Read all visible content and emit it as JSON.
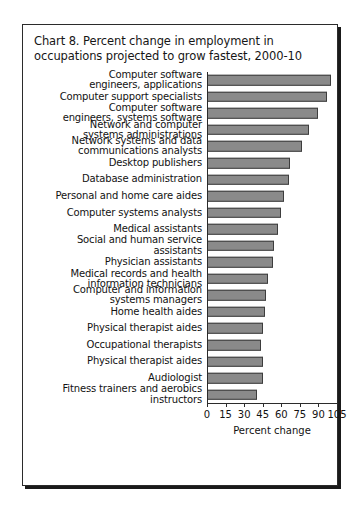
{
  "figure": {
    "title": "Chart 8. Percent change in employment in occupations projected to grow fastest, 2000-10",
    "frame_border_color": "#2b2b2b",
    "background_color": "#ffffff"
  },
  "chart_data": {
    "type": "bar",
    "orientation": "horizontal",
    "title": "Chart 8. Percent change in employment in occupations projected to grow fastest, 2000-10",
    "xlabel": "Percent change",
    "ylabel": "",
    "xlim": [
      0,
      105
    ],
    "xticks": [
      0,
      15,
      30,
      45,
      60,
      75,
      90,
      105
    ],
    "xtick_labels": [
      "0",
      "15",
      "30",
      "45",
      "60",
      "75",
      "90",
      "105"
    ],
    "grid": false,
    "legend": null,
    "bar_color": "#8a8a8a",
    "bar_edge_color": "#3d3d3d",
    "categories": [
      "Computer software\nengineers, applications",
      "Computer support specialists",
      "Computer software\nengineers, systems software",
      "Network and computer\nsystems administrations",
      "Network systems and data\ncommunications analysts",
      "Desktop publishers",
      "Database administration",
      "Personal and home care aides",
      "Computer systems analysts",
      "Medical assistants",
      "Social and human service\nassistants",
      "Physician assistants",
      "Medical records and health\ninformation technicians",
      "Computer and information\nsystems managers",
      "Home health aides",
      "Physical therapist aides",
      "Occupational therapists",
      "Physical therapist aides",
      "Audiologist",
      "Fitness trainers and aerobics\ninstructors"
    ],
    "values": [
      100,
      97,
      90,
      82,
      77,
      67,
      66,
      62,
      60,
      57,
      54,
      53,
      49,
      48,
      47,
      45,
      44,
      45,
      45,
      40
    ]
  },
  "axis": {
    "x_title": "Percent change",
    "ticks": [
      "0",
      "15",
      "30",
      "45",
      "60",
      "75",
      "90",
      "105"
    ]
  }
}
